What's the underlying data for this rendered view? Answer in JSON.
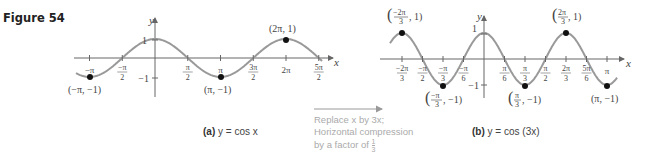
{
  "figure": {
    "label": "Figure 54"
  },
  "graph_a": {
    "caption_prefix": "(a)",
    "caption_eq": "y = cos x",
    "x_axis_label": "x",
    "y_axis_label": "y",
    "y_ticks": [
      "1",
      "−1"
    ],
    "x_ticks": [
      {
        "num": "−π",
        "den": ""
      },
      {
        "num": "−π",
        "den": "2"
      },
      {
        "num": "π",
        "den": "2"
      },
      {
        "num": "π",
        "den": ""
      },
      {
        "num": "3π",
        "den": "2"
      },
      {
        "num": "2π",
        "den": ""
      },
      {
        "num": "5π",
        "den": "2"
      }
    ],
    "points": [
      "(−π, −1)",
      "(π, −1)",
      "(2π, 1)"
    ]
  },
  "transform_note": {
    "line1": "Replace x by 3x;",
    "line2": "Horizontal compression",
    "line3": "by a factor of",
    "fraction": "1/3"
  },
  "graph_b": {
    "caption_prefix": "(b)",
    "caption_eq": "y = cos (3x)",
    "x_axis_label": "x",
    "y_axis_label": "y",
    "y_ticks": [
      "1",
      "−1"
    ],
    "x_ticks": [
      {
        "num": "−2π",
        "den": "3"
      },
      {
        "num": "−π",
        "den": "2"
      },
      {
        "num": "−π",
        "den": "3"
      },
      {
        "num": "−π",
        "den": "6"
      },
      {
        "num": "π",
        "den": "6"
      },
      {
        "num": "π",
        "den": "3"
      },
      {
        "num": "π",
        "den": "2"
      },
      {
        "num": "2π",
        "den": "3"
      },
      {
        "num": "5π",
        "den": "6"
      },
      {
        "num": "π",
        "den": ""
      }
    ],
    "points": [
      "(−2π/3, 1)",
      "(−π/3, −1)",
      "(π/3, −1)",
      "(2π/3, 1)",
      "(π, −1)"
    ]
  },
  "chart_data": [
    {
      "type": "line",
      "title": "(a) y = cos x",
      "xlabel": "x",
      "ylabel": "y",
      "x_ticks": [
        "−π",
        "−π/2",
        "π/2",
        "π",
        "3π/2",
        "2π",
        "5π/2"
      ],
      "y_ticks": [
        1,
        -1
      ],
      "xlim": [
        -3.4,
        8.2
      ],
      "ylim": [
        -1.2,
        1.2
      ],
      "series": [
        {
          "name": "cos x",
          "function": "cos(x)"
        }
      ],
      "highlighted_points": [
        {
          "x": -3.1416,
          "y": -1,
          "label": "(−π, −1)"
        },
        {
          "x": 3.1416,
          "y": -1,
          "label": "(π, −1)"
        },
        {
          "x": 6.2832,
          "y": 1,
          "label": "(2π, 1)"
        }
      ]
    },
    {
      "type": "line",
      "title": "(b) y = cos (3x)",
      "xlabel": "x",
      "ylabel": "y",
      "x_ticks": [
        "−2π/3",
        "−π/2",
        "−π/3",
        "−π/6",
        "π/6",
        "π/3",
        "π/2",
        "2π/3",
        "5π/6",
        "π"
      ],
      "y_ticks": [
        1,
        -1
      ],
      "xlim": [
        -2.3,
        3.3
      ],
      "ylim": [
        -1.2,
        1.2
      ],
      "series": [
        {
          "name": "cos(3x)",
          "function": "cos(3x)"
        }
      ],
      "highlighted_points": [
        {
          "x": -2.0944,
          "y": 1,
          "label": "(−2π/3, 1)"
        },
        {
          "x": -1.0472,
          "y": -1,
          "label": "(−π/3, −1)"
        },
        {
          "x": 1.0472,
          "y": -1,
          "label": "(π/3, −1)"
        },
        {
          "x": 2.0944,
          "y": 1,
          "label": "(2π/3, 1)"
        },
        {
          "x": 3.1416,
          "y": -1,
          "label": "(π, −1)"
        }
      ],
      "annotation": "Replace x by 3x; Horizontal compression by a factor of 1/3"
    }
  ]
}
